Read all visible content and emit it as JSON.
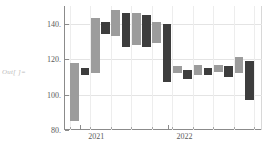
{
  "out_prompt": "Out[ ]=",
  "chart_data": {
    "type": "bar",
    "subtype": "waterfall",
    "title": "",
    "xlabel": "",
    "ylabel": "",
    "ylim": [
      80,
      150
    ],
    "yticks": [
      80,
      100,
      120,
      140
    ],
    "ytick_labels": [
      "80.",
      "100.",
      "120.",
      "140."
    ],
    "xtick_labels": [
      "2021",
      "2022"
    ],
    "xtick_positions": [
      2021,
      2022
    ],
    "grid": true,
    "legend": null,
    "colors": {
      "light": "#9c9c9c",
      "dark": "#3d3d3d",
      "axis": "#8b8b8b",
      "gridline": "#e4e4e4",
      "background": "#ffffff"
    },
    "categories": [
      "2020-Q4",
      "2021-Q1",
      "2021-Q2",
      "2021-Q3",
      "2021-Q4",
      "2022-Q1",
      "2022-Q2",
      "2022-Q3",
      "2022-Q4",
      "2023-Q1",
      "2023-Q2",
      "2023-Q3",
      "2023-Q4",
      "2024-Q1",
      "2024-Q2",
      "2024-Q3",
      "2024-Q4",
      "2025-Q1"
    ],
    "bars": [
      {
        "index": 0,
        "color": "light",
        "high": 118,
        "low": 85
      },
      {
        "index": 1,
        "color": "dark",
        "high": 115,
        "low": 111
      },
      {
        "index": 2,
        "color": "light",
        "high": 143,
        "low": 112
      },
      {
        "index": 3,
        "color": "dark",
        "high": 141,
        "low": 134
      },
      {
        "index": 4,
        "color": "light",
        "high": 148,
        "low": 133
      },
      {
        "index": 5,
        "color": "dark",
        "high": 146,
        "low": 127
      },
      {
        "index": 6,
        "color": "light",
        "high": 146,
        "low": 128
      },
      {
        "index": 7,
        "color": "dark",
        "high": 145,
        "low": 127
      },
      {
        "index": 8,
        "color": "light",
        "high": 141,
        "low": 129
      },
      {
        "index": 9,
        "color": "dark",
        "high": 140,
        "low": 107
      },
      {
        "index": 10,
        "color": "light",
        "high": 116,
        "low": 112
      },
      {
        "index": 11,
        "color": "dark",
        "high": 114,
        "low": 109
      },
      {
        "index": 12,
        "color": "light",
        "high": 117,
        "low": 111
      },
      {
        "index": 13,
        "color": "dark",
        "high": 115,
        "low": 111
      },
      {
        "index": 14,
        "color": "light",
        "high": 117,
        "low": 113
      },
      {
        "index": 15,
        "color": "dark",
        "high": 116,
        "low": 110
      },
      {
        "index": 16,
        "color": "light",
        "high": 121,
        "low": 112
      },
      {
        "index": 17,
        "color": "dark",
        "high": 119,
        "low": 97
      }
    ]
  }
}
